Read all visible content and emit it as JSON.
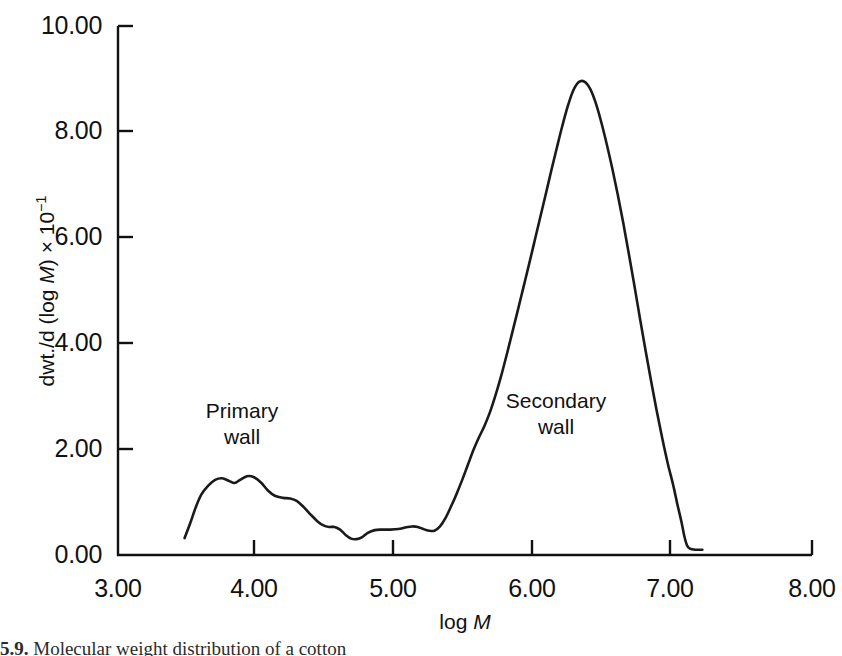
{
  "figure": {
    "caption_number": "5.9.",
    "caption_text": "Molecular weight distribution of a cotton",
    "line_color": "#1a1a1a",
    "axis_color": "#111111",
    "background": "#ffffff"
  },
  "chart_data": {
    "type": "line",
    "title": "",
    "xlabel_text": "log M",
    "xlabel_prefix": "log ",
    "xlabel_var": "M",
    "ylabel_prefix": "dwt./d (log ",
    "ylabel_var": "M",
    "ylabel_suffix": ") × 10",
    "ylabel_exponent": "−1",
    "ylabel_text": "dwt./d (log M) × 10⁻¹",
    "xlim": [
      3.0,
      8.0
    ],
    "ylim": [
      0.0,
      10.0
    ],
    "grid": false,
    "legend": "none",
    "xticks": [
      3.0,
      4.0,
      5.0,
      6.0,
      7.0,
      8.0
    ],
    "xtick_labels": [
      "3.00",
      "4.00",
      "5.00",
      "6.00",
      "7.00",
      "8.00"
    ],
    "yticks": [
      0.0,
      2.0,
      4.0,
      6.0,
      8.0,
      10.0
    ],
    "ytick_labels": [
      "0.00",
      "2.00",
      "4.00",
      "6.00",
      "8.00",
      "10.00"
    ],
    "annotations": [
      {
        "name": "primary-wall",
        "text": "Primary\nwall",
        "x": 3.75,
        "y": 3.1
      },
      {
        "name": "secondary-wall",
        "text": "Secondary\nwall",
        "x": 5.95,
        "y": 3.3
      }
    ],
    "series": [
      {
        "name": "molecular weight distribution",
        "points": [
          [
            3.48,
            0.32
          ],
          [
            3.52,
            0.6
          ],
          [
            3.56,
            0.9
          ],
          [
            3.6,
            1.14
          ],
          [
            3.65,
            1.31
          ],
          [
            3.7,
            1.42
          ],
          [
            3.75,
            1.45
          ],
          [
            3.8,
            1.4
          ],
          [
            3.84,
            1.36
          ],
          [
            3.88,
            1.42
          ],
          [
            3.93,
            1.49
          ],
          [
            3.98,
            1.47
          ],
          [
            4.03,
            1.37
          ],
          [
            4.08,
            1.22
          ],
          [
            4.13,
            1.12
          ],
          [
            4.19,
            1.08
          ],
          [
            4.24,
            1.07
          ],
          [
            4.29,
            1.02
          ],
          [
            4.34,
            0.9
          ],
          [
            4.39,
            0.76
          ],
          [
            4.44,
            0.63
          ],
          [
            4.48,
            0.56
          ],
          [
            4.52,
            0.53
          ],
          [
            4.56,
            0.53
          ],
          [
            4.6,
            0.48
          ],
          [
            4.64,
            0.38
          ],
          [
            4.68,
            0.31
          ],
          [
            4.72,
            0.3
          ],
          [
            4.76,
            0.34
          ],
          [
            4.8,
            0.42
          ],
          [
            4.85,
            0.47
          ],
          [
            4.9,
            0.48
          ],
          [
            4.96,
            0.48
          ],
          [
            5.02,
            0.49
          ],
          [
            5.07,
            0.52
          ],
          [
            5.12,
            0.54
          ],
          [
            5.16,
            0.53
          ],
          [
            5.2,
            0.49
          ],
          [
            5.24,
            0.46
          ],
          [
            5.28,
            0.46
          ],
          [
            5.32,
            0.54
          ],
          [
            5.36,
            0.7
          ],
          [
            5.4,
            0.92
          ],
          [
            5.44,
            1.16
          ],
          [
            5.48,
            1.42
          ],
          [
            5.52,
            1.7
          ],
          [
            5.56,
            1.98
          ],
          [
            5.6,
            2.22
          ],
          [
            5.64,
            2.44
          ],
          [
            5.68,
            2.7
          ],
          [
            5.72,
            3.02
          ],
          [
            5.76,
            3.38
          ],
          [
            5.8,
            3.78
          ],
          [
            5.84,
            4.2
          ],
          [
            5.88,
            4.62
          ],
          [
            5.92,
            5.05
          ],
          [
            5.96,
            5.48
          ],
          [
            6.0,
            5.92
          ],
          [
            6.04,
            6.36
          ],
          [
            6.08,
            6.8
          ],
          [
            6.12,
            7.25
          ],
          [
            6.16,
            7.68
          ],
          [
            6.2,
            8.1
          ],
          [
            6.24,
            8.48
          ],
          [
            6.28,
            8.78
          ],
          [
            6.32,
            8.94
          ],
          [
            6.36,
            8.95
          ],
          [
            6.4,
            8.82
          ],
          [
            6.44,
            8.56
          ],
          [
            6.48,
            8.2
          ],
          [
            6.52,
            7.78
          ],
          [
            6.56,
            7.32
          ],
          [
            6.6,
            6.82
          ],
          [
            6.64,
            6.28
          ],
          [
            6.68,
            5.7
          ],
          [
            6.72,
            5.1
          ],
          [
            6.76,
            4.48
          ],
          [
            6.8,
            3.88
          ],
          [
            6.84,
            3.3
          ],
          [
            6.88,
            2.74
          ],
          [
            6.92,
            2.22
          ],
          [
            6.96,
            1.74
          ],
          [
            7.0,
            1.32
          ],
          [
            7.03,
            0.96
          ],
          [
            7.06,
            0.62
          ],
          [
            7.08,
            0.36
          ],
          [
            7.1,
            0.18
          ],
          [
            7.12,
            0.12
          ],
          [
            7.16,
            0.1
          ],
          [
            7.21,
            0.1
          ]
        ]
      }
    ]
  }
}
